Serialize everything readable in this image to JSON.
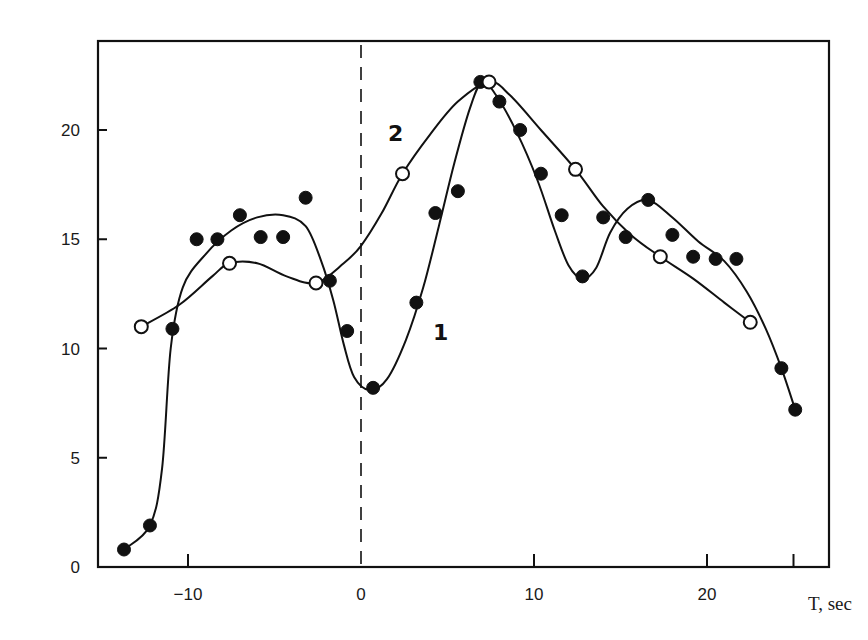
{
  "chart_data": {
    "type": "scatter",
    "title": "",
    "xlabel": "T, sec",
    "ylabel": "",
    "xlim": [
      -15,
      27
    ],
    "ylim": [
      0,
      24
    ],
    "grid": false,
    "legend": "inline curve labels (1 near filled-point curve, 2 near open-point curve)",
    "x_ticks": [
      -10,
      0,
      10,
      20,
      25
    ],
    "x_tick_labels": [
      "-10",
      "0",
      "10",
      "20"
    ],
    "y_ticks": [
      0,
      5,
      10,
      15,
      20
    ],
    "y_tick_labels": [
      "0",
      "5",
      "10",
      "15",
      "20"
    ],
    "reference_line": {
      "type": "vertical-dashed",
      "x": 0
    },
    "series": [
      {
        "name": "1",
        "marker": "filled-circle",
        "points": [
          {
            "x": -13.7,
            "y": 0.8
          },
          {
            "x": -12.2,
            "y": 1.9
          },
          {
            "x": -10.9,
            "y": 10.9
          },
          {
            "x": -9.5,
            "y": 15.0
          },
          {
            "x": -8.3,
            "y": 15.0
          },
          {
            "x": -7.0,
            "y": 16.1
          },
          {
            "x": -5.8,
            "y": 15.1
          },
          {
            "x": -4.5,
            "y": 15.1
          },
          {
            "x": -3.2,
            "y": 16.9
          },
          {
            "x": -1.8,
            "y": 13.1
          },
          {
            "x": -0.8,
            "y": 10.8
          },
          {
            "x": 0.7,
            "y": 8.2
          },
          {
            "x": 3.2,
            "y": 12.1
          },
          {
            "x": 4.3,
            "y": 16.2
          },
          {
            "x": 5.6,
            "y": 17.2
          },
          {
            "x": 6.9,
            "y": 22.2
          },
          {
            "x": 8.0,
            "y": 21.3
          },
          {
            "x": 9.2,
            "y": 20.0
          },
          {
            "x": 10.4,
            "y": 18.0
          },
          {
            "x": 11.6,
            "y": 16.1
          },
          {
            "x": 12.8,
            "y": 13.3
          },
          {
            "x": 14.0,
            "y": 16.0
          },
          {
            "x": 15.3,
            "y": 15.1
          },
          {
            "x": 16.6,
            "y": 16.8
          },
          {
            "x": 18.0,
            "y": 15.2
          },
          {
            "x": 19.2,
            "y": 14.2
          },
          {
            "x": 20.5,
            "y": 14.1
          },
          {
            "x": 21.7,
            "y": 14.1
          },
          {
            "x": 24.3,
            "y": 9.1
          },
          {
            "x": 25.1,
            "y": 7.2
          }
        ],
        "curve": [
          [
            -13.7,
            0.8
          ],
          [
            -12.2,
            1.9
          ],
          [
            -11.5,
            4.5
          ],
          [
            -11.0,
            10.0
          ],
          [
            -10.3,
            12.8
          ],
          [
            -9.0,
            14.3
          ],
          [
            -7.5,
            15.4
          ],
          [
            -6.0,
            16.0
          ],
          [
            -4.5,
            16.1
          ],
          [
            -3.2,
            15.6
          ],
          [
            -2.3,
            14.0
          ],
          [
            -1.6,
            12.2
          ],
          [
            -1.0,
            10.2
          ],
          [
            -0.4,
            8.7
          ],
          [
            0.5,
            8.1
          ],
          [
            1.5,
            8.6
          ],
          [
            2.6,
            10.4
          ],
          [
            3.6,
            12.8
          ],
          [
            4.5,
            15.6
          ],
          [
            5.4,
            18.5
          ],
          [
            6.3,
            21.0
          ],
          [
            7.0,
            22.2
          ],
          [
            7.8,
            21.6
          ],
          [
            9.0,
            19.9
          ],
          [
            10.2,
            17.7
          ],
          [
            11.2,
            15.4
          ],
          [
            12.0,
            13.8
          ],
          [
            12.8,
            13.2
          ],
          [
            13.6,
            13.7
          ],
          [
            14.4,
            15.3
          ],
          [
            15.4,
            16.4
          ],
          [
            16.6,
            16.8
          ],
          [
            18.0,
            16.0
          ],
          [
            19.5,
            14.9
          ],
          [
            21.0,
            14.0
          ],
          [
            22.3,
            12.6
          ],
          [
            23.4,
            10.9
          ],
          [
            24.3,
            9.1
          ],
          [
            25.1,
            7.2
          ]
        ]
      },
      {
        "name": "2",
        "marker": "open-circle",
        "points": [
          {
            "x": -12.7,
            "y": 11.0
          },
          {
            "x": -7.6,
            "y": 13.9
          },
          {
            "x": -2.6,
            "y": 13.0
          },
          {
            "x": 2.4,
            "y": 18.0
          },
          {
            "x": 7.4,
            "y": 22.2
          },
          {
            "x": 12.4,
            "y": 18.2
          },
          {
            "x": 17.3,
            "y": 14.2
          },
          {
            "x": 22.5,
            "y": 11.2
          }
        ],
        "curve": [
          [
            -12.7,
            11.0
          ],
          [
            -10.5,
            12.0
          ],
          [
            -8.6,
            13.3
          ],
          [
            -7.6,
            13.9
          ],
          [
            -6.0,
            13.9
          ],
          [
            -4.3,
            13.3
          ],
          [
            -2.6,
            13.0
          ],
          [
            -1.0,
            13.9
          ],
          [
            0.0,
            14.7
          ],
          [
            1.2,
            16.2
          ],
          [
            2.4,
            18.0
          ],
          [
            4.0,
            19.8
          ],
          [
            5.6,
            21.3
          ],
          [
            7.4,
            22.2
          ],
          [
            8.6,
            21.6
          ],
          [
            10.4,
            20.0
          ],
          [
            12.4,
            18.2
          ],
          [
            14.0,
            16.5
          ],
          [
            15.6,
            15.2
          ],
          [
            17.3,
            14.2
          ],
          [
            19.2,
            13.2
          ],
          [
            21.0,
            12.1
          ],
          [
            22.5,
            11.2
          ]
        ]
      }
    ],
    "annotations": [
      {
        "text": "1",
        "x": 4.6,
        "y": 10.4
      },
      {
        "text": "2",
        "x": 2.0,
        "y": 19.5
      }
    ]
  },
  "plot": {
    "frame": {
      "left": 98,
      "top": 41,
      "right": 829,
      "bottom": 567
    },
    "x_px": {
      "origin": 361,
      "per_unit": 17.3
    },
    "y_px": {
      "origin": 567,
      "per_unit": 21.85
    },
    "colors": {
      "ink": "#111111",
      "background": "#ffffff"
    }
  }
}
